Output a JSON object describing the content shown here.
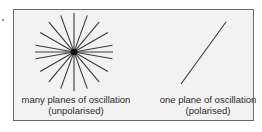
{
  "diagram": {
    "left_panel": {
      "caption_line1": "many planes of oscillation",
      "caption_line2": "(unpolarised)",
      "figure": "star-of-lines",
      "rays": 18
    },
    "right_panel": {
      "caption_line1": "one plane of oscillation",
      "caption_line2": "(polarised)",
      "figure": "single-diagonal-line"
    },
    "colors": {
      "background": "#f2f2f2",
      "border": "#6a6a6a",
      "lines": "#333333",
      "text": "#2a2a2a"
    }
  }
}
